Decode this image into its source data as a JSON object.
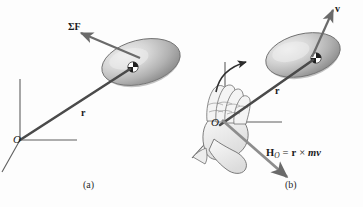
{
  "figure": {
    "background_color": "#fdfdfd",
    "ink_color": "#4a4a4a",
    "text_color": "#1a1a1a",
    "disk_fill_light": "#e8e8e8",
    "disk_fill_mid": "#b9b9b9",
    "disk_fill_dark": "#8f8f8f",
    "hand_fill": "#f2f2f2",
    "hand_stroke": "#6e6e6e"
  },
  "panels": [
    {
      "id": "a",
      "caption": "(a)",
      "origin_label": "O",
      "labels": [
        {
          "name": "sum-forces",
          "text": "ΣF"
        },
        {
          "name": "position-vector",
          "text": "r"
        }
      ]
    },
    {
      "id": "b",
      "caption": "(b)",
      "origin_label": "O",
      "labels": [
        {
          "name": "velocity-vector",
          "text": "v"
        },
        {
          "name": "position-vector",
          "text": "r"
        }
      ],
      "equation": {
        "symbol": "H",
        "subscript": "O",
        "equals": "=",
        "term_r": "r",
        "cross": "×",
        "term_mv": "mv",
        "full_text": "H_O = r × mv"
      }
    }
  ]
}
